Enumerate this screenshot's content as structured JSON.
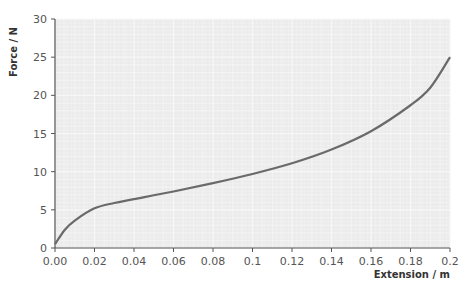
{
  "chart_data": {
    "type": "line",
    "title": "",
    "xlabel": "Extension / m",
    "ylabel": "Force / N",
    "xlim": [
      0,
      0.2
    ],
    "ylim": [
      0,
      30
    ],
    "grid": true,
    "legend": null,
    "x_ticks": [
      "0.00",
      "0.02",
      "0.04",
      "0.06",
      "0.08",
      "0.1",
      "0.12",
      "0.14",
      "0.16",
      "0.18",
      "0.2"
    ],
    "y_ticks": [
      "0",
      "5",
      "10",
      "15",
      "20",
      "25",
      "30"
    ],
    "series": [
      {
        "name": "Force vs extension",
        "x": [
          0.0,
          0.005,
          0.01,
          0.02,
          0.03,
          0.04,
          0.06,
          0.08,
          0.1,
          0.12,
          0.14,
          0.16,
          0.18,
          0.19,
          0.2
        ],
        "values": [
          0.5,
          2.4,
          3.6,
          5.2,
          5.9,
          6.4,
          7.4,
          8.5,
          9.7,
          11.1,
          12.9,
          15.3,
          18.7,
          21.0,
          25.0
        ]
      }
    ],
    "colors": {
      "line": "#6a6a6a",
      "axis": "#555555",
      "grid_minor": "#e6e6e6",
      "grid_major": "#f6f6f6",
      "plot_bg": "#ececec"
    }
  }
}
